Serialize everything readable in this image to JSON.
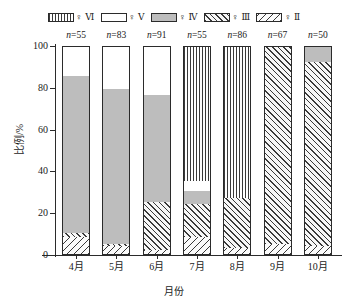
{
  "legend": {
    "items": [
      {
        "pattern": "VI",
        "label": "♀ Ⅵ",
        "key": "pat-VI"
      },
      {
        "pattern": "V",
        "label": "♀ Ⅴ",
        "key": "pat-V"
      },
      {
        "pattern": "IV",
        "label": "♀ Ⅳ",
        "key": "pat-IV"
      },
      {
        "pattern": "III",
        "label": "♀ Ⅲ",
        "key": "pat-III"
      },
      {
        "pattern": "II",
        "label": "♀ Ⅱ",
        "key": "pat-II"
      }
    ]
  },
  "axes": {
    "ylabel": "比例/%",
    "xlabel": "月份",
    "yticks": [
      "0",
      "20",
      "40",
      "60",
      "80",
      "100"
    ],
    "ymin": 0,
    "ymax": 100
  },
  "chart_data": {
    "type": "bar",
    "title": "",
    "subtitle": "",
    "xlabel": "月份",
    "ylabel": "比例/%",
    "ylim": [
      0,
      100
    ],
    "grid": false,
    "legend_position": "top",
    "stacked": true,
    "stack_order_bottom_to_top": [
      "II",
      "III",
      "IV",
      "V",
      "VI"
    ],
    "categories": [
      "4月",
      "5月",
      "6月",
      "7月",
      "8月",
      "9月",
      "10月"
    ],
    "sample_sizes": [
      55,
      83,
      91,
      55,
      86,
      67,
      50
    ],
    "sample_size_labels": [
      "n=55",
      "n=83",
      "n=91",
      "n=55",
      "n=86",
      "n=67",
      "n=50"
    ],
    "series": [
      {
        "name": "♀ Ⅱ",
        "pattern": "II",
        "values": [
          8,
          4,
          2,
          8,
          3,
          5,
          4
        ]
      },
      {
        "name": "♀ Ⅲ",
        "pattern": "III",
        "values": [
          2,
          1,
          23,
          16,
          24,
          95,
          88
        ]
      },
      {
        "name": "♀ Ⅳ",
        "pattern": "IV",
        "values": [
          75,
          74,
          51,
          6,
          0,
          0,
          8
        ]
      },
      {
        "name": "♀ Ⅴ",
        "pattern": "V",
        "values": [
          15,
          21,
          24,
          5,
          0,
          0,
          0
        ]
      },
      {
        "name": "♀ Ⅵ",
        "pattern": "VI",
        "values": [
          0,
          0,
          0,
          65,
          73,
          0,
          0
        ]
      }
    ]
  }
}
